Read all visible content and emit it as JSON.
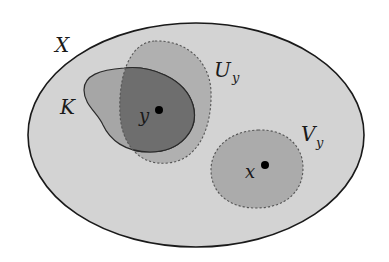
{
  "diagram": {
    "type": "set-diagram",
    "colors": {
      "background": "#ffffff",
      "space_fill": "#d3d3d3",
      "space_stroke": "#1a1a1a",
      "compact_fill": "#a6a6a6",
      "compact_stroke": "#2a2a2a",
      "neighborhood_fill": "#b0b0b0",
      "overlap_fill": "#6e6e6e",
      "neighborhood_x_fill": "#ababab",
      "dashed_stroke": "#555555",
      "point_fill": "#000000"
    },
    "labels": {
      "space": "X",
      "compact_set": "K",
      "neighborhood_y_main": "U",
      "neighborhood_y_sub": "y",
      "neighborhood_x_main": "V",
      "neighborhood_x_sub": "y",
      "point_y": "y",
      "point_x": "x"
    },
    "shapes": [
      {
        "name": "X",
        "kind": "ellipse",
        "style": "solid",
        "description": "Large ellipse representing the space X"
      },
      {
        "name": "K",
        "kind": "blob",
        "style": "solid",
        "description": "Compact set K, irregular blob"
      },
      {
        "name": "U_y",
        "kind": "blob",
        "style": "dashed",
        "description": "Open neighborhood of y overlapping K"
      },
      {
        "name": "V_y",
        "kind": "blob",
        "style": "dashed",
        "description": "Open neighborhood of x, disjoint from U_y"
      }
    ],
    "points": [
      {
        "name": "y",
        "inside": [
          "K",
          "U_y"
        ]
      },
      {
        "name": "x",
        "inside": [
          "V_y"
        ]
      }
    ]
  }
}
